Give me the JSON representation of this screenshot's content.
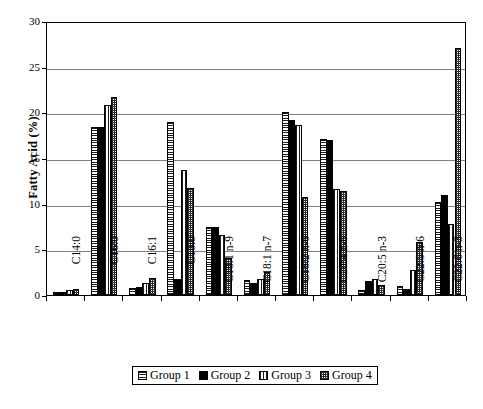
{
  "chart": {
    "type": "bar",
    "ylabel": "Fatty Acid (%)"
  },
  "legend": {
    "position": "bottom",
    "items": [
      {
        "label": "Group 1",
        "pattern": "horizontal-lines"
      },
      {
        "label": "Group 2",
        "pattern": "solid-black"
      },
      {
        "label": "Group 3",
        "pattern": "vertical-lines"
      },
      {
        "label": "Group 4",
        "pattern": "checkered"
      }
    ]
  },
  "chart_data": {
    "type": "bar",
    "title": "",
    "subtitle": "",
    "xlabel": "",
    "ylabel": "Fatty Acid (%)",
    "ylim": [
      0,
      30
    ],
    "yticks": [
      0,
      5,
      10,
      15,
      20,
      25,
      30
    ],
    "ytick_labels": [
      "0",
      "5",
      "10",
      "15",
      "20",
      "25",
      "30"
    ],
    "grid": true,
    "legend_position": "bottom",
    "categories": [
      "C14:0",
      "C16:0",
      "C16:1",
      "C18:0",
      "C18:1 n-9",
      "C18:1 n-7",
      "C18:2 n-6",
      "C20:4 n-6",
      "C20:5 n-3",
      "C22:5 n-6",
      "C22:6 n-3"
    ],
    "series": [
      {
        "name": "Group 1",
        "pattern": "horizontal-lines",
        "values": [
          0.3,
          18.4,
          0.8,
          18.9,
          7.4,
          1.6,
          20.0,
          17.1,
          0.6,
          1.0,
          10.2
        ]
      },
      {
        "name": "Group 2",
        "pattern": "solid-black",
        "values": [
          0.3,
          18.4,
          0.9,
          1.7,
          7.4,
          1.3,
          19.2,
          17.0,
          1.5,
          0.7,
          10.9
        ]
      },
      {
        "name": "Group 3",
        "pattern": "vertical-lines",
        "values": [
          0.6,
          20.8,
          1.3,
          13.7,
          6.6,
          1.8,
          18.6,
          11.6,
          1.7,
          2.7,
          7.8
        ]
      },
      {
        "name": "Group 4",
        "pattern": "checkered",
        "values": [
          0.7,
          21.7,
          1.9,
          11.7,
          4.0,
          2.5,
          10.7,
          11.4,
          1.1,
          5.8,
          27.0
        ]
      }
    ]
  }
}
